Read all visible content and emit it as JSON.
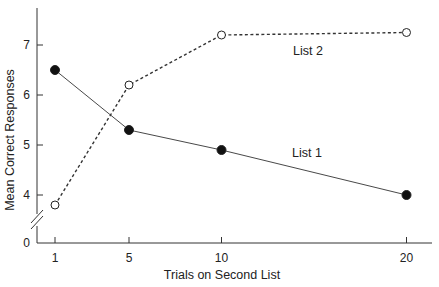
{
  "chart_data": {
    "type": "line",
    "title": "",
    "xlabel": "Trials on Second List",
    "ylabel": "Mean Correct Responses",
    "x": [
      1,
      5,
      10,
      20
    ],
    "xticks": [
      "1",
      "5",
      "10",
      "20"
    ],
    "yticks": [
      "0",
      "4",
      "5",
      "6",
      "7"
    ],
    "ylim": [
      0,
      7.8
    ],
    "y_axis_break": true,
    "grid": false,
    "series": [
      {
        "name": "List 1",
        "style": "solid",
        "marker": "filled-circle",
        "values": [
          6.5,
          5.3,
          4.9,
          4.0
        ]
      },
      {
        "name": "List 2",
        "style": "dashed",
        "marker": "open-circle",
        "values": [
          3.8,
          6.2,
          7.2,
          7.25
        ]
      }
    ],
    "annotations": [
      {
        "text": "List 2",
        "series": "List 2"
      },
      {
        "text": "List 1",
        "series": "List 1"
      }
    ]
  },
  "colors": {
    "ink": "#222222",
    "background": "#ffffff"
  }
}
